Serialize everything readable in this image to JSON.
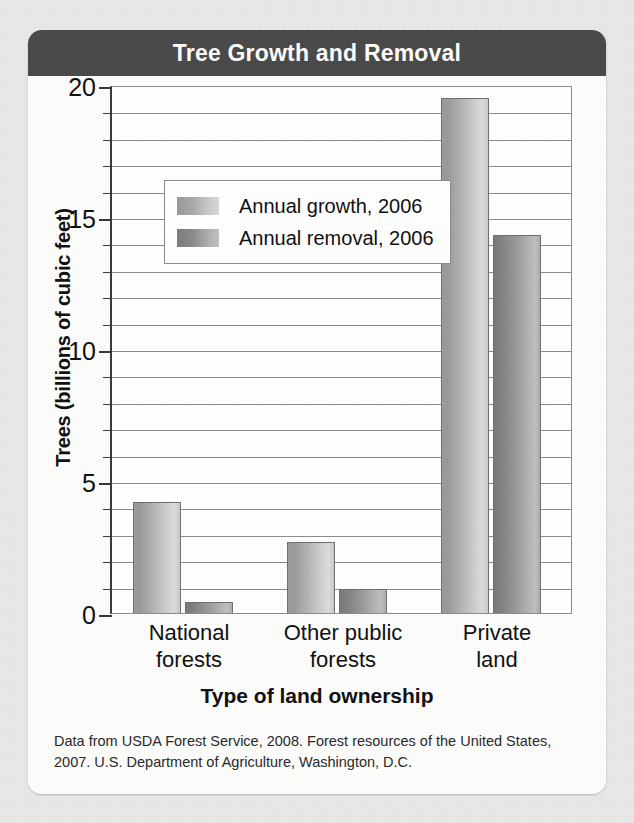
{
  "card": {
    "title": "Tree Growth and Removal"
  },
  "source_note": "Data from USDA Forest Service, 2008. Forest resources of the United States, 2007. U.S. Department of Agriculture, Washington, D.C.",
  "colors": {
    "header_bar": "#4a4a4a",
    "page_background": "#e8e8e6",
    "card_background": "#fdfdfc",
    "growth_bar": "#b6b6b6",
    "removal_bar": "#9a9a9a",
    "gridline": "#8c8c8c",
    "axis": "#3a3a3a",
    "title_text": "#ffffff"
  },
  "chart_data": {
    "type": "bar",
    "title": "Tree Growth and Removal",
    "xlabel": "Type of land ownership",
    "ylabel": "Trees (billions of cubic feet)",
    "categories": [
      "National forests",
      "Other public forests",
      "Private land"
    ],
    "category_lines": [
      [
        "National",
        "forests"
      ],
      [
        "Other public",
        "forests"
      ],
      [
        "Private",
        "land"
      ]
    ],
    "series": [
      {
        "name": "Annual growth, 2006",
        "values": [
          4.2,
          2.7,
          19.5
        ]
      },
      {
        "name": "Annual removal, 2006",
        "values": [
          0.4,
          0.9,
          14.3
        ]
      }
    ],
    "ylim": [
      0,
      20
    ],
    "ytick_labels": [
      "0",
      "5",
      "10",
      "15",
      "20"
    ],
    "ytick_values": [
      0,
      5,
      10,
      15,
      20
    ],
    "minor_tick_interval": 1,
    "grid": true,
    "legend_position": "upper-left-inside"
  }
}
